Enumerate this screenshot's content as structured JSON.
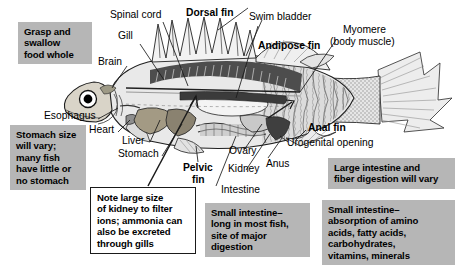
{
  "figure": {
    "colors": {
      "callout_gray": "#b6b6b6",
      "callout_white": "#ffffff",
      "outline": "#1a1a1a",
      "body_dark": "#4a4a4a",
      "body_mid": "#8d8d8d",
      "body_light": "#d8d8d8",
      "page": "#ffffff"
    }
  },
  "callouts": [
    {
      "id": "grasp",
      "text": "Grasp and swallow food whole",
      "style": "gray"
    },
    {
      "id": "stomach_size",
      "text": "Stomach size will vary; many fish have little or no stomach",
      "style": "gray"
    },
    {
      "id": "kidney_note",
      "text": "Note large size of kidney to filter ions; ammonia can also be excreted through gills",
      "style": "white"
    },
    {
      "id": "small_int_1",
      "text": "Small intestine– long in most fish, site of major digestion",
      "style": "gray"
    },
    {
      "id": "large_int",
      "text": "Large intestine and fiber digestion will vary",
      "style": "gray"
    },
    {
      "id": "small_int_2",
      "text": "Small intestine– absorption of amino acids, fatty acids, carbohydrates, vitamins, minerals",
      "style": "gray"
    }
  ],
  "callout_lines": {
    "grasp": [
      "Grasp and",
      "swallow",
      "food whole"
    ],
    "stomach_size": [
      "Stomach size",
      "will vary;",
      "many fish",
      "have little or",
      "no stomach"
    ],
    "kidney_note": [
      "Note large size",
      "of kidney to filter",
      "ions; ammonia can",
      "also be excreted",
      "through gills"
    ],
    "small_int_1": [
      "Small intestine–",
      "long in most fish,",
      "site of major",
      "digestion"
    ],
    "large_int": [
      "Large intestine and",
      "fiber digestion will vary"
    ],
    "small_int_2": [
      "Small intestine–",
      "absorption of amino",
      "acids, fatty acids,",
      "carbohydrates,",
      "vitamins, minerals"
    ]
  },
  "labels": {
    "spinal_cord": "Spinal cord",
    "dorsal_fin": "Dorsal fin",
    "swim_bladder": "Swim bladder",
    "myomere_l1": "Myomere",
    "myomere_l2": "(body muscle)",
    "gill": "Gill",
    "andipose_fin": "Andipose fin",
    "brain": "Brain",
    "esophagus": "Esophagus",
    "heart": "Heart",
    "liver": "Liver",
    "stomach": "Stomach",
    "anal_fin": "Anal fin",
    "urogenital_opening": "Urogenital opening",
    "ovary": "Ovary",
    "kidney": "Kidney",
    "anus": "Anus",
    "pelvic_fin_l1": "Pelvic",
    "pelvic_fin_l2": "fin",
    "intestine": "Intestine"
  }
}
